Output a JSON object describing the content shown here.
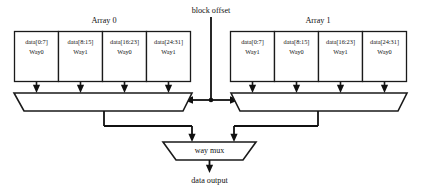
{
  "diagram": {
    "colors": {
      "background": "#ffffff",
      "line": "#1a1a1a",
      "text": "#111111",
      "box_fill": "#ffffff"
    },
    "top_signal": {
      "label": "block offset"
    },
    "output_signal": {
      "label": "data output"
    },
    "way_mux": {
      "label": "way mux"
    },
    "arrays": [
      {
        "title": "Array 0",
        "cells": [
          {
            "range": "data[0:7]",
            "way": "Way0"
          },
          {
            "range": "data[8:15]",
            "way": "Way1"
          },
          {
            "range": "data[16:23]",
            "way": "Way0"
          },
          {
            "range": "data[24:31]",
            "way": "Way1"
          }
        ]
      },
      {
        "title": "Array 1",
        "cells": [
          {
            "range": "data[0:7]",
            "way": "Way1"
          },
          {
            "range": "data[8:15]",
            "way": "Way0"
          },
          {
            "range": "data[16:23]",
            "way": "Way1"
          },
          {
            "range": "data[24:31]",
            "way": "Way0"
          }
        ]
      }
    ]
  }
}
